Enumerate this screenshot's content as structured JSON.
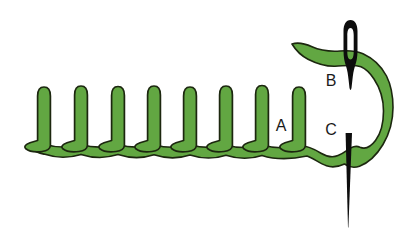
{
  "diagram": {
    "labels": {
      "a": "A",
      "b": "B",
      "c": "C"
    },
    "stitch_count": 8,
    "posts": [
      {
        "x": 44,
        "top": 87
      },
      {
        "x": 81,
        "top": 86
      },
      {
        "x": 118,
        "top": 86.5
      },
      {
        "x": 154,
        "top": 86
      },
      {
        "x": 190,
        "top": 87
      },
      {
        "x": 226,
        "top": 86
      },
      {
        "x": 262,
        "top": 85.5
      },
      {
        "x": 299,
        "top": 87
      }
    ]
  },
  "colors": {
    "thread_green": "#62a742",
    "outline_dark": "#1c270f",
    "needle_black": "#0d0d0d",
    "label_text": "#1a1a1a",
    "background": "#ffffff"
  }
}
